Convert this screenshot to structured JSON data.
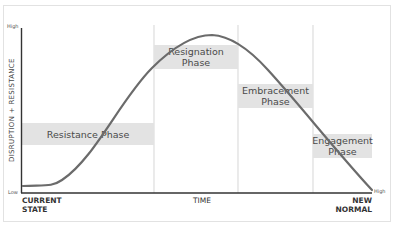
{
  "diagram": {
    "type": "change-curve",
    "y_axis": {
      "label": "DISRUPTION + RESISTANCE",
      "high_label": "High",
      "low_label": "Low"
    },
    "x_axis": {
      "start_label_line1": "CURRENT",
      "start_label_line2": "STATE",
      "middle_label": "TIME",
      "end_label_line1": "NEW",
      "end_label_line2": "NORMAL",
      "end_high_label": "High"
    },
    "phases": [
      {
        "line1": "Resistance Phase",
        "line2": ""
      },
      {
        "line1": "Resignation",
        "line2": "Phase"
      },
      {
        "line1": "Embracement",
        "line2": "Phase"
      },
      {
        "line1": "Engagement",
        "line2": "Phase"
      }
    ],
    "colors": {
      "curve": "#6b6b6b",
      "axis": "#333333",
      "phase_box": "#e3e3e3",
      "divider": "#dddddd"
    }
  }
}
